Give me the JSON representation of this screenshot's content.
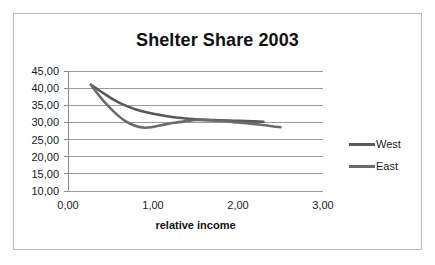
{
  "chart_data": {
    "type": "line",
    "title": "Shelter Share 2003",
    "xlabel": "relative income",
    "ylabel": "",
    "xlim": [
      0,
      3
    ],
    "ylim": [
      10,
      45
    ],
    "grid": true,
    "grid_axis": "y",
    "legend_position": "right",
    "x_ticks": [
      "0,00",
      "1,00",
      "2,00",
      "3,00"
    ],
    "x_tick_values": [
      0,
      1,
      2,
      3
    ],
    "y_ticks": [
      "10,00",
      "15,00",
      "20,00",
      "25,00",
      "30,00",
      "35,00",
      "40,00",
      "45,00"
    ],
    "y_tick_values": [
      10,
      15,
      20,
      25,
      30,
      35,
      40,
      45
    ],
    "series": [
      {
        "name": "West",
        "color": "#595959",
        "x": [
          0.27,
          0.4,
          0.52,
          0.65,
          0.8,
          0.95,
          1.1,
          1.25,
          1.4,
          1.5,
          1.65,
          1.8,
          1.95,
          2.1,
          2.2,
          2.3
        ],
        "values": [
          41.0,
          38.8,
          36.9,
          35.2,
          33.8,
          32.8,
          32.1,
          31.5,
          31.1,
          30.9,
          30.8,
          30.6,
          30.5,
          30.4,
          30.3,
          30.2
        ]
      },
      {
        "name": "East",
        "color": "#6b6b6b",
        "x": [
          0.27,
          0.38,
          0.48,
          0.58,
          0.68,
          0.78,
          0.88,
          0.98,
          1.1,
          1.25,
          1.4,
          1.5,
          1.65,
          1.8,
          1.95,
          2.1,
          2.25,
          2.4,
          2.5
        ],
        "values": [
          41.0,
          37.4,
          34.6,
          32.2,
          30.3,
          29.1,
          28.5,
          28.6,
          29.2,
          29.9,
          30.4,
          30.7,
          30.6,
          30.4,
          30.1,
          29.8,
          29.4,
          28.9,
          28.6
        ]
      }
    ],
    "legend": [
      {
        "label": "West",
        "color": "#595959"
      },
      {
        "label": "East",
        "color": "#6b6b6b"
      }
    ]
  }
}
